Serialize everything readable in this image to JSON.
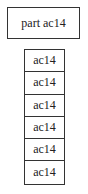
{
  "part": {
    "label": "part ac14"
  },
  "stack": {
    "rows": [
      {
        "label": "ac14"
      },
      {
        "label": "ac14"
      },
      {
        "label": "ac14"
      },
      {
        "label": "ac14"
      },
      {
        "label": "ac14"
      },
      {
        "label": "ac14"
      }
    ]
  }
}
